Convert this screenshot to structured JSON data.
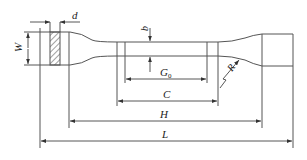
{
  "diagram": {
    "type": "tensile-test-specimen-drawing",
    "colors": {
      "line": "#555555",
      "text": "#222222",
      "background": "#ffffff"
    },
    "labels": {
      "thickness": "d",
      "width": "W",
      "reduced_width": "b",
      "gauge_length": "G",
      "gauge_length_subscript": "0",
      "radius": "R",
      "reduced_section_length": "C",
      "distance_between_grips": "H",
      "overall_length": "L"
    },
    "dimensions": [
      {
        "id": "d",
        "label": "d",
        "orientation": "horizontal"
      },
      {
        "id": "W",
        "label": "W",
        "orientation": "vertical"
      },
      {
        "id": "b",
        "label": "b",
        "orientation": "vertical"
      },
      {
        "id": "G0",
        "label": "G0",
        "orientation": "horizontal"
      },
      {
        "id": "R",
        "label": "R",
        "orientation": "radial"
      },
      {
        "id": "C",
        "label": "C",
        "orientation": "horizontal"
      },
      {
        "id": "H",
        "label": "H",
        "orientation": "horizontal"
      },
      {
        "id": "L",
        "label": "L",
        "orientation": "horizontal"
      }
    ]
  }
}
